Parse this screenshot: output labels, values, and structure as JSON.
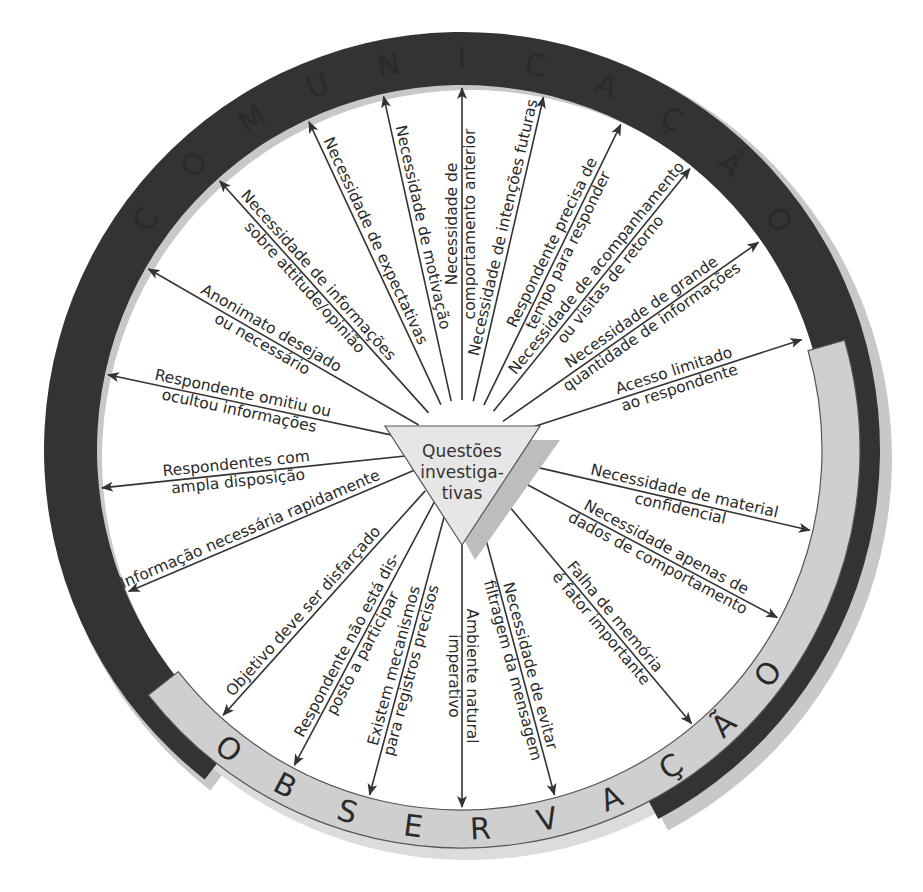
{
  "colors": {
    "communication_ring": "#333333",
    "communication_text": "#ffffff",
    "observation_ring": "#cfcfcf",
    "observation_text": "#2a2a2a",
    "shadow": "#c8c8c8",
    "center_fill": "#e6e6e6",
    "arrow": "#333333"
  },
  "center": {
    "lines": [
      "Questões",
      "investiga-",
      "tivas"
    ]
  },
  "rings": {
    "communication": {
      "label": "COMUNICAÇÃO",
      "letters": [
        "C",
        "O",
        "M",
        "U",
        "N",
        "I",
        "C",
        "A",
        "Ç",
        "Ã",
        "O"
      ]
    },
    "observation": {
      "label": "OBSERVAÇÃO",
      "letters": [
        "O",
        "B",
        "S",
        "E",
        "R",
        "V",
        "A",
        "Ç",
        "Ã",
        "O"
      ]
    }
  },
  "communication_factors": [
    {
      "id": "c1",
      "lines": [
        "Necessidade de",
        "comportamento anterior"
      ]
    },
    {
      "id": "c2",
      "lines": [
        "Necessidade de motivação"
      ]
    },
    {
      "id": "c3",
      "lines": [
        "Necessidade de expectativas"
      ]
    },
    {
      "id": "c4",
      "lines": [
        "Necessidade de informações",
        "sobre attitude/opinião"
      ]
    },
    {
      "id": "c5",
      "lines": [
        "Anonimato desejado",
        "ou necessário"
      ]
    },
    {
      "id": "c6",
      "lines": [
        "Respondente omitiu ou",
        "ocultou informações"
      ]
    },
    {
      "id": "c7",
      "lines": [
        "Respondentes com",
        "ampla disposição"
      ]
    },
    {
      "id": "c8",
      "lines": [
        "Informação necessária rapidamente"
      ]
    },
    {
      "id": "c9",
      "lines": [
        "Necessidade de intenções futuras"
      ]
    },
    {
      "id": "c10",
      "lines": [
        "Respondente precisa de",
        "tempo para responder"
      ]
    },
    {
      "id": "c11",
      "lines": [
        "Necessidade de acompanhamento",
        "ou visitas de retorno"
      ]
    },
    {
      "id": "c12",
      "lines": [
        "Necessidade de grande",
        "quantidade de informações"
      ]
    }
  ],
  "observation_factors": [
    {
      "id": "o1",
      "lines": [
        "Acesso limitado",
        "ao respondente"
      ]
    },
    {
      "id": "o2",
      "lines": [
        "Necessidade de material",
        "confidencial"
      ]
    },
    {
      "id": "o3",
      "lines": [
        "Necessidade apenas de",
        "dados de comportamento"
      ]
    },
    {
      "id": "o4",
      "lines": [
        "Falha de memória",
        "é fator importante"
      ]
    },
    {
      "id": "o5",
      "lines": [
        "Necessidade de evitar",
        "filtragem da mensagem"
      ]
    },
    {
      "id": "o6",
      "lines": [
        "Ambiente natural",
        "imperativo"
      ]
    },
    {
      "id": "o7",
      "lines": [
        "Existem mecanismos",
        "para registros precisos"
      ]
    },
    {
      "id": "o8",
      "lines": [
        "Respondente não está dis-",
        "posto a participar"
      ]
    },
    {
      "id": "o9",
      "lines": [
        "Objetivo deve ser disfarçado"
      ]
    }
  ]
}
